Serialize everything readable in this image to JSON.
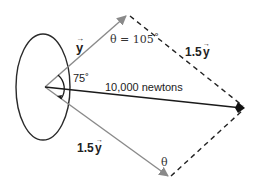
{
  "diagram": {
    "title": "",
    "colors": {
      "vector_gray": "#8a8a8a",
      "resultant": "#1a1a1a",
      "dashed": "#222222",
      "ellipse": "#2a2a2a",
      "text": "#222222"
    },
    "labels": {
      "upper_vector": "y",
      "upper_vector_arrow": "→",
      "upper_angle": "θ = 105˚",
      "upper_dashed": "1.5",
      "upper_dashed_var": "y",
      "upper_dashed_arrow": "→",
      "inner_angle": "75˚",
      "resultant": "10,000 newtons",
      "lower_vector": "1.5",
      "lower_vector_var": "y",
      "lower_vector_arrow": "→",
      "lower_angle": "θ"
    },
    "geometry": {
      "origin": [
        45,
        87
      ],
      "ellipse_center": [
        43,
        87
      ],
      "ellipse_radii": [
        27,
        53
      ],
      "upper_tip": [
        128,
        15
      ],
      "lower_tip": [
        170,
        177
      ],
      "resultant_tip": [
        245,
        108
      ]
    }
  }
}
